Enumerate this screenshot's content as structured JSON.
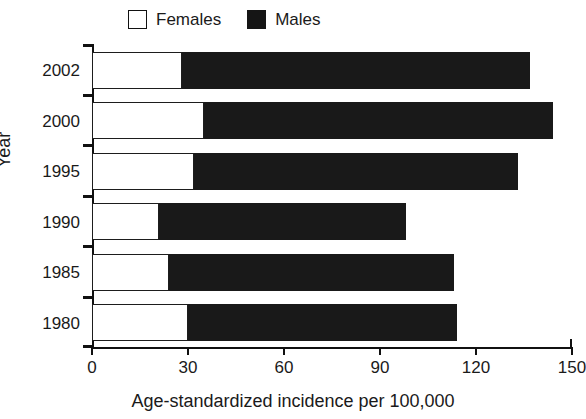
{
  "chart_data": {
    "type": "bar",
    "orientation": "horizontal",
    "stacked": true,
    "title": "",
    "xlabel": "Age-standardized incidence per 100,000",
    "ylabel": "Year",
    "categories": [
      "2002",
      "2000",
      "1995",
      "1990",
      "1985",
      "1980"
    ],
    "category_order_top_to_bottom": [
      "2002",
      "2000",
      "1995",
      "1990",
      "1985",
      "1980"
    ],
    "series": [
      {
        "name": "Females",
        "values": [
          28,
          35,
          32,
          21,
          24,
          30
        ],
        "color": "#ffffff"
      },
      {
        "name": "Males",
        "values": [
          109,
          109,
          101,
          77,
          89,
          84
        ],
        "color": "#191919"
      }
    ],
    "totals": [
      137,
      144,
      133,
      98,
      113,
      114
    ],
    "xlim": [
      0,
      150
    ],
    "xticks": [
      0,
      30,
      60,
      90,
      120,
      150
    ],
    "xtick_labels": [
      "0",
      "30",
      "60",
      "90",
      "120",
      "150"
    ],
    "grid": false,
    "legend_position": "top-center"
  },
  "legend": {
    "entries": [
      {
        "label": "Females",
        "swatch": "open-square"
      },
      {
        "label": "Males",
        "swatch": "filled-square"
      }
    ]
  },
  "axes": {
    "x_title": "Age-standardized incidence per 100,000",
    "y_title": "Year"
  }
}
